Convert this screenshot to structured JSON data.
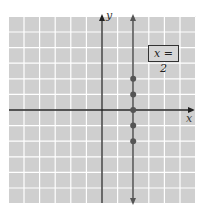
{
  "graph": {
    "x_axis_label": "x",
    "y_axis_label": "y",
    "equation_label": "x = 2",
    "line": {
      "type": "vertical",
      "x": 2
    },
    "points": [
      {
        "x": 2,
        "y": 2
      },
      {
        "x": 2,
        "y": 1
      },
      {
        "x": 2,
        "y": 0
      },
      {
        "x": 2,
        "y": -1
      },
      {
        "x": 2,
        "y": -2
      }
    ],
    "grid": {
      "x_min": -6,
      "x_max": 6,
      "y_min": -6,
      "y_max": 6
    },
    "colors": {
      "background": "#cfcfcf",
      "grid_line": "#ffffff",
      "axis": "#222222",
      "line": "#555555",
      "point": "#555555"
    }
  }
}
